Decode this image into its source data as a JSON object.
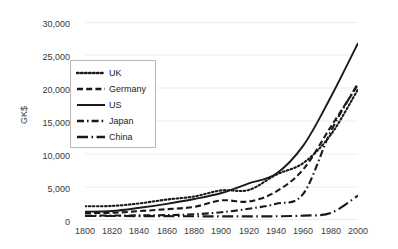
{
  "chart_data": {
    "type": "line",
    "title": "",
    "xlabel": "",
    "ylabel": "GK$",
    "xlim": [
      1800,
      2000
    ],
    "ylim": [
      0,
      30000
    ],
    "grid": true,
    "legend_position": "inside-upper-left",
    "x_ticks": [
      "1800",
      "1820",
      "1840",
      "1860",
      "1880",
      "1900",
      "1920",
      "1940",
      "1960",
      "1980",
      "2000"
    ],
    "y_ticks": [
      "0",
      "5,000",
      "10,000",
      "15,000",
      "20,000",
      "25,000",
      "30,000"
    ],
    "x": [
      1800,
      1820,
      1840,
      1860,
      1880,
      1900,
      1920,
      1940,
      1960,
      1980,
      2000
    ],
    "series": [
      {
        "name": "UK",
        "style": "dotted",
        "values": [
          2080,
          2130,
          2520,
          3100,
          3560,
          4490,
          4550,
          6860,
          8650,
          12900,
          19800
        ]
      },
      {
        "name": "Germany",
        "style": "dashed",
        "values": [
          1080,
          1090,
          1350,
          1640,
          1990,
          2980,
          2800,
          4300,
          7700,
          14100,
          20500
        ]
      },
      {
        "name": "US",
        "style": "solid",
        "values": [
          1250,
          1360,
          1850,
          2450,
          3180,
          4090,
          5550,
          7000,
          11300,
          18600,
          26800
        ]
      },
      {
        "name": "Japan",
        "style": "dash-dot",
        "values": [
          670,
          680,
          700,
          740,
          860,
          1180,
          1700,
          2450,
          3990,
          13400,
          20700
        ]
      },
      {
        "name": "China",
        "style": "long-dash-dot",
        "values": [
          600,
          600,
          590,
          580,
          560,
          550,
          550,
          560,
          670,
          1060,
          3700
        ]
      }
    ]
  },
  "axis": {
    "y_label": "GK$"
  }
}
